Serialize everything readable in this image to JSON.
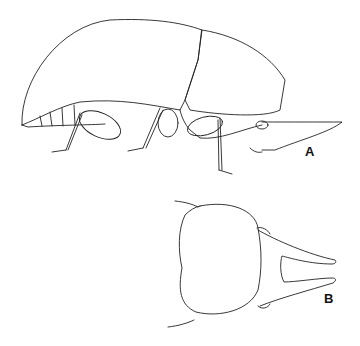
{
  "figure": {
    "panels": [
      {
        "id": "A",
        "label": "A",
        "description": "lateral view of beetle"
      },
      {
        "id": "B",
        "label": "B",
        "description": "dorsal view of head with forked rostrum"
      }
    ],
    "line_color": "#222222",
    "background": "#ffffff"
  }
}
